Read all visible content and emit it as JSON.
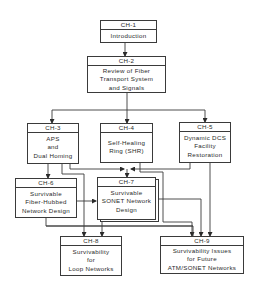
{
  "diagram": {
    "nodes": [
      {
        "id": "ch1",
        "header": "CH-1",
        "lines": [
          "Introduction"
        ]
      },
      {
        "id": "ch2",
        "header": "CH-2",
        "lines": [
          "Review of Fiber",
          "Transport System",
          "and Signals"
        ]
      },
      {
        "id": "ch3",
        "header": "CH-3",
        "lines": [
          "APS",
          "and",
          "Dual Homing"
        ]
      },
      {
        "id": "ch4",
        "header": "CH-4",
        "lines": [
          "Self-Healing",
          "Ring (SHR)"
        ]
      },
      {
        "id": "ch5",
        "header": "CH-5",
        "lines": [
          "Dynamic DCS",
          "Facility",
          "Restoration"
        ]
      },
      {
        "id": "ch6",
        "header": "CH-6",
        "lines": [
          "Survivable",
          "Fiber-Hubbed",
          "Network Design"
        ]
      },
      {
        "id": "ch7",
        "header": "CH-7",
        "lines": [
          "Survivable",
          "SONET Network",
          "Design"
        ]
      },
      {
        "id": "ch8",
        "header": "CH-8",
        "lines": [
          "Survivability",
          "for",
          "Loop Networks"
        ]
      },
      {
        "id": "ch9",
        "header": "CH-9",
        "lines": [
          "Survivability Issues",
          "for Future",
          "ATM/SONET Networks"
        ]
      }
    ],
    "edges": [
      [
        "ch1",
        "ch2"
      ],
      [
        "ch2",
        "ch3"
      ],
      [
        "ch2",
        "ch4"
      ],
      [
        "ch2",
        "ch5"
      ],
      [
        "ch3",
        "ch6"
      ],
      [
        "ch3",
        "ch7"
      ],
      [
        "ch3",
        "ch8"
      ],
      [
        "ch4",
        "ch7"
      ],
      [
        "ch4",
        "ch9"
      ],
      [
        "ch5",
        "ch7"
      ],
      [
        "ch5",
        "ch9"
      ],
      [
        "ch6",
        "ch7"
      ],
      [
        "ch6",
        "ch9"
      ],
      [
        "ch7",
        "ch8"
      ],
      [
        "ch7",
        "ch9"
      ]
    ],
    "line_color": "#3a3a3a"
  }
}
